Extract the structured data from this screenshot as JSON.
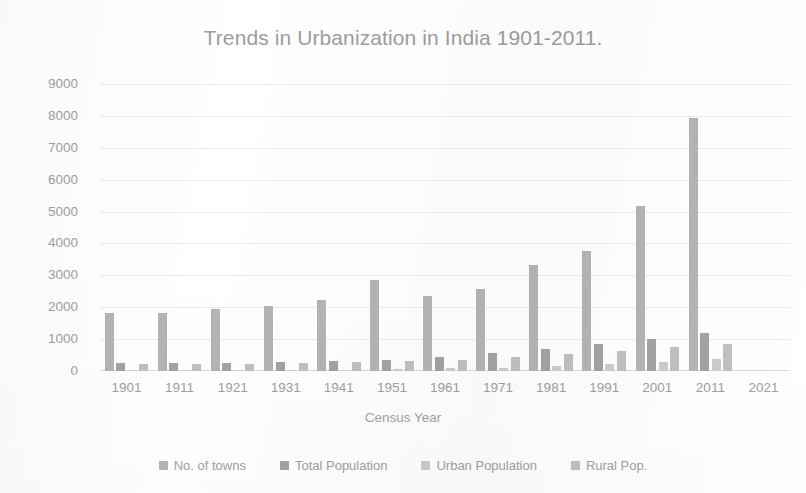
{
  "chart_data": {
    "type": "bar",
    "title": "Trends in Urbanization in India 1901-2011.",
    "xlabel": "Census Year",
    "ylabel": "Population",
    "categories": [
      "1901",
      "1911",
      "1921",
      "1931",
      "1941",
      "1951",
      "1961",
      "1971",
      "1981",
      "1991",
      "2001",
      "2011",
      "2021"
    ],
    "ylim": [
      0,
      9000
    ],
    "yticks": [
      9000,
      8000,
      7000,
      6000,
      5000,
      4000,
      3000,
      2000,
      1000,
      0
    ],
    "grid": true,
    "legend_position": "bottom",
    "series": [
      {
        "name": "No. of towns",
        "color": "#b4b4b4",
        "values": [
          1830,
          1820,
          1950,
          2050,
          2230,
          2840,
          2340,
          2580,
          3330,
          3760,
          5160,
          7930,
          null
        ]
      },
      {
        "name": "Total Population",
        "color": "#a3a3a3",
        "values": [
          240,
          250,
          250,
          280,
          320,
          360,
          440,
          550,
          680,
          840,
          1000,
          1190,
          null
        ]
      },
      {
        "name": "Urban Population",
        "color": "#cccccc",
        "values": [
          26,
          26,
          28,
          33,
          44,
          62,
          79,
          109,
          159,
          218,
          286,
          377,
          null
        ]
      },
      {
        "name": "Rural Pop.",
        "color": "#c0c0c0",
        "values": [
          213,
          226,
          223,
          246,
          275,
          299,
          360,
          439,
          524,
          629,
          743,
          833,
          null
        ]
      }
    ]
  },
  "colors": {
    "title_text": "#9d9d9d",
    "axis_text": "#a0a0a0",
    "gridline": "#ececec",
    "baseline": "#d9d9d9",
    "background": "#ffffff"
  }
}
